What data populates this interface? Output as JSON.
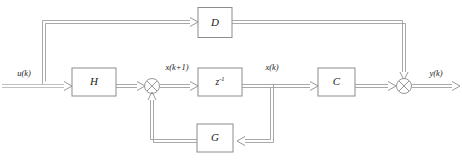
{
  "diagram": {
    "blocks": [
      {
        "id": "H",
        "label": "H",
        "name": "block-h"
      },
      {
        "id": "Z",
        "label": "z",
        "exponent": "-1",
        "name": "block-unit-delay"
      },
      {
        "id": "C",
        "label": "C",
        "name": "block-c"
      },
      {
        "id": "D",
        "label": "D",
        "name": "block-d"
      },
      {
        "id": "G",
        "label": "G",
        "name": "block-g"
      }
    ],
    "signals": {
      "input": "u(k)",
      "state_next": "x(k+1)",
      "state": "x(k)",
      "output": "y(k)"
    },
    "junctions": [
      {
        "id": "sum1",
        "symbol": "cross-circle",
        "name": "summing-junction-state"
      },
      {
        "id": "sum2",
        "symbol": "cross-circle",
        "name": "summing-junction-output"
      }
    ],
    "colors": {
      "line": "#9a9a9a",
      "box_stroke": "#8c8c8c",
      "text": "#1a1a1a",
      "background": "#ffffff"
    }
  }
}
